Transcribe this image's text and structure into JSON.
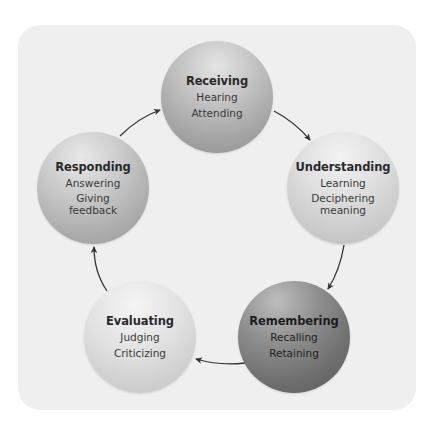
{
  "diagram": {
    "type": "cycle",
    "nodes": [
      {
        "id": "receiving",
        "title": "Receiving",
        "lines": [
          "Hearing",
          "Attending"
        ]
      },
      {
        "id": "understanding",
        "title": "Understanding",
        "lines": [
          "Learning",
          "Deciphering meaning"
        ],
        "line2_parts": [
          "Deciphering",
          "meaning"
        ]
      },
      {
        "id": "remembering",
        "title": "Remembering",
        "lines": [
          "Recalling",
          "Retaining"
        ]
      },
      {
        "id": "evaluating",
        "title": "Evaluating",
        "lines": [
          "Judging",
          "Criticizing"
        ]
      },
      {
        "id": "responding",
        "title": "Responding",
        "lines": [
          "Answering",
          "Giving feedback"
        ],
        "line2_parts": [
          "Giving",
          "feedback"
        ]
      }
    ],
    "edges": [
      {
        "from": "receiving",
        "to": "understanding"
      },
      {
        "from": "understanding",
        "to": "remembering"
      },
      {
        "from": "remembering",
        "to": "evaluating"
      },
      {
        "from": "evaluating",
        "to": "responding"
      },
      {
        "from": "responding",
        "to": "receiving"
      }
    ],
    "colors": {
      "panel": "#efefef",
      "arrow": "#333333"
    }
  }
}
